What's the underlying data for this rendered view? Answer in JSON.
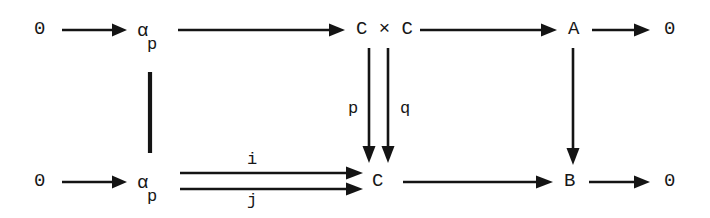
{
  "diagram": {
    "kind": "commutative-diagram",
    "background_color": "#ffffff",
    "ink_color": "#141414",
    "top_row": {
      "nodes": [
        {
          "id": "top-zero-left",
          "text": "0",
          "sub": ""
        },
        {
          "id": "top-alpha-p",
          "text": "α",
          "sub": "p"
        },
        {
          "id": "top-c-times-c",
          "text": "C × C",
          "sub": ""
        },
        {
          "id": "top-a",
          "text": "A",
          "sub": ""
        },
        {
          "id": "top-zero-right",
          "text": "0",
          "sub": ""
        }
      ],
      "arrow_labels": [
        "",
        "",
        "",
        ""
      ]
    },
    "bottom_row": {
      "nodes": [
        {
          "id": "bottom-zero-left",
          "text": "0",
          "sub": ""
        },
        {
          "id": "bottom-alpha-p",
          "text": "α",
          "sub": "p"
        },
        {
          "id": "bottom-c",
          "text": "C",
          "sub": ""
        },
        {
          "id": "bottom-b",
          "text": "B",
          "sub": ""
        },
        {
          "id": "bottom-zero-right",
          "text": "0",
          "sub": ""
        }
      ],
      "parallel_arrow_labels": {
        "upper": "i",
        "lower": "j"
      }
    },
    "vertical_maps": [
      {
        "id": "identity-bar",
        "from": "top-alpha-p",
        "to": "bottom-alpha-p",
        "label": "",
        "style": "identity-line"
      },
      {
        "id": "map-p",
        "from": "top-c-times-c",
        "to": "bottom-c",
        "label": "p",
        "style": "arrow"
      },
      {
        "id": "map-q",
        "from": "top-c-times-c",
        "to": "bottom-c",
        "label": "q",
        "style": "arrow"
      },
      {
        "id": "map-a-to-b",
        "from": "top-a",
        "to": "bottom-b",
        "label": "",
        "style": "arrow"
      }
    ]
  }
}
